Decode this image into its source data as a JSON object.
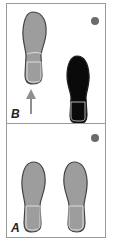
{
  "panels": [
    {
      "id": "B",
      "label": "B",
      "elements": [
        "gray left footprint (forward)",
        "black right footprint (stepping)",
        "upward arrow",
        "dot marker"
      ]
    },
    {
      "id": "A",
      "label": "A",
      "elements": [
        "gray left footprint",
        "gray right footprint",
        "dot marker"
      ]
    }
  ],
  "colors": {
    "footprint_gray": "#9d9d9d",
    "footprint_black": "#0a0a0a",
    "arrow": "#8f8f8f",
    "dot": "#6b6b6b",
    "border": "#9a9a9a"
  }
}
